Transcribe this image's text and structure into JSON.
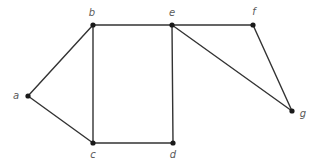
{
  "figure": {
    "name": "undirected-graph-diagram",
    "background_color": "#ffffff",
    "edge_color": "#333333",
    "vertex_color": "#1a1a1a",
    "label_color": "#5a5a5a",
    "width": 319,
    "height": 164
  },
  "chart_data": {
    "type": "diagram",
    "subtype": "undirected-graph",
    "title": "",
    "xlabel": "",
    "ylabel": "",
    "grid": false,
    "legend": null,
    "nodes": [
      {
        "id": "a",
        "label": "a",
        "x": 28,
        "y": 96,
        "label_x": 16,
        "label_y": 96,
        "label_anchor": "middle"
      },
      {
        "id": "b",
        "label": "b",
        "x": 93,
        "y": 25,
        "label_x": 92,
        "label_y": 13,
        "label_anchor": "middle"
      },
      {
        "id": "c",
        "label": "c",
        "x": 93,
        "y": 143,
        "label_x": 93,
        "label_y": 155,
        "label_anchor": "middle"
      },
      {
        "id": "d",
        "label": "d",
        "x": 173,
        "y": 143,
        "label_x": 173,
        "label_y": 155,
        "label_anchor": "middle"
      },
      {
        "id": "e",
        "label": "e",
        "x": 172,
        "y": 25,
        "label_x": 172,
        "label_y": 13,
        "label_anchor": "middle"
      },
      {
        "id": "f",
        "label": "f",
        "x": 253,
        "y": 25,
        "label_x": 254,
        "label_y": 12,
        "label_anchor": "middle"
      },
      {
        "id": "g",
        "label": "g",
        "x": 292,
        "y": 111,
        "label_x": 303,
        "label_y": 114,
        "label_anchor": "middle"
      }
    ],
    "edges": [
      {
        "from": "a",
        "to": "b"
      },
      {
        "from": "a",
        "to": "c"
      },
      {
        "from": "b",
        "to": "c"
      },
      {
        "from": "b",
        "to": "e"
      },
      {
        "from": "c",
        "to": "d"
      },
      {
        "from": "d",
        "to": "e"
      },
      {
        "from": "e",
        "to": "f"
      },
      {
        "from": "e",
        "to": "g"
      },
      {
        "from": "f",
        "to": "g"
      }
    ],
    "node_radius": 2.6,
    "edge_width": 1.4
  }
}
